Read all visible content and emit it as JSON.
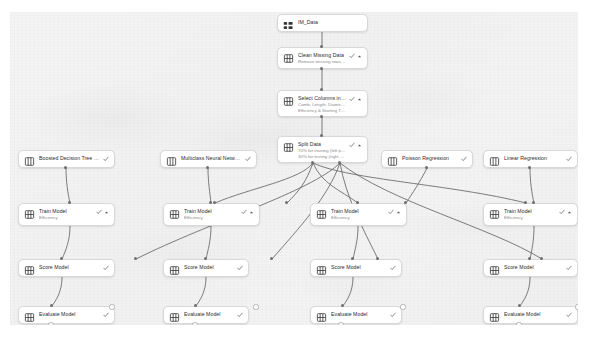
{
  "app": {
    "name": "pipeline-designer-canvas",
    "canvas_background": "#f2f2f2",
    "node_background": "#ffffff",
    "node_border": "#d8d8d8",
    "edge_color": "#4a4a4a",
    "status_icon": "checkmark",
    "status_color": "#5a5a5a"
  },
  "nodes": [
    {
      "id": "dataset",
      "name": "dataset-node",
      "title": "IM_Data",
      "subtitle": "",
      "icon": "dataset-icon",
      "status": "",
      "chevron": false,
      "x": 277,
      "y": 14,
      "w": 91,
      "h": 18
    },
    {
      "id": "clean-missing-data",
      "name": "clean-missing-data-node",
      "title": "Clean Missing Data",
      "subtitle": "Remove missing rows values",
      "icon": "module-icon",
      "status": "check",
      "chevron": true,
      "x": 277,
      "y": 47,
      "w": 91,
      "h": 22
    },
    {
      "id": "select-columns",
      "name": "select-columns-node",
      "title": "Select Columns in Dataset",
      "subtitle": "Comb, Length, Diameter,",
      "subtitle2": "Efficiency & Starting Torque",
      "icon": "module-icon",
      "status": "check",
      "chevron": true,
      "x": 277,
      "y": 90,
      "w": 91,
      "h": 27
    },
    {
      "id": "split-data",
      "name": "split-data-node",
      "title": "Split Data",
      "subtitle": "70% for training (left port)",
      "subtitle2": "30% for testing (right port)",
      "icon": "module-icon",
      "status": "check",
      "chevron": true,
      "x": 277,
      "y": 136,
      "w": 91,
      "h": 27
    },
    {
      "id": "alg-1",
      "name": "boosted-decision-tree-regression-node",
      "title": "Boosted Decision Tree Regre...",
      "subtitle": "",
      "icon": "algorithm-icon",
      "status": "check",
      "chevron": false,
      "x": 18,
      "y": 150,
      "w": 97,
      "h": 18
    },
    {
      "id": "alg-2",
      "name": "multiclass-neural-network-node",
      "title": "Multiclass Neural Network",
      "subtitle": "",
      "icon": "algorithm-icon",
      "status": "check",
      "chevron": false,
      "x": 160,
      "y": 150,
      "w": 97,
      "h": 18
    },
    {
      "id": "alg-3",
      "name": "poisson-regression-node",
      "title": "Poisson Regression",
      "subtitle": "",
      "icon": "algorithm-icon",
      "status": "check",
      "chevron": false,
      "x": 381,
      "y": 150,
      "w": 92,
      "h": 18
    },
    {
      "id": "alg-4",
      "name": "linear-regression-node",
      "title": "Linear Regression",
      "subtitle": "",
      "icon": "algorithm-icon",
      "status": "check",
      "chevron": false,
      "x": 483,
      "y": 150,
      "w": 95,
      "h": 18
    },
    {
      "id": "train-1",
      "name": "train-model-node-1",
      "title": "Train Model",
      "subtitle": "Efficiency",
      "icon": "module-icon",
      "status": "check",
      "chevron": true,
      "x": 18,
      "y": 203,
      "w": 97,
      "h": 23
    },
    {
      "id": "train-2",
      "name": "train-model-node-2",
      "title": "Train Model",
      "subtitle": "Efficiency",
      "icon": "module-icon",
      "status": "check",
      "chevron": true,
      "x": 163,
      "y": 203,
      "w": 97,
      "h": 23
    },
    {
      "id": "train-3",
      "name": "train-model-node-3",
      "title": "Train Model",
      "subtitle": "Efficiency",
      "icon": "module-icon",
      "status": "check",
      "chevron": true,
      "x": 310,
      "y": 203,
      "w": 97,
      "h": 23
    },
    {
      "id": "train-4",
      "name": "train-model-node-4",
      "title": "Train Model",
      "subtitle": "Efficiency",
      "icon": "module-icon",
      "status": "check",
      "chevron": true,
      "x": 483,
      "y": 203,
      "w": 95,
      "h": 23
    },
    {
      "id": "score-1",
      "name": "score-model-node-1",
      "title": "Score Model",
      "subtitle": "",
      "icon": "module-icon",
      "status": "check",
      "chevron": false,
      "x": 18,
      "y": 259,
      "w": 97,
      "h": 18
    },
    {
      "id": "score-2",
      "name": "score-model-node-2",
      "title": "Score Model",
      "subtitle": "",
      "icon": "module-icon",
      "status": "check",
      "chevron": false,
      "x": 163,
      "y": 259,
      "w": 86,
      "h": 18
    },
    {
      "id": "score-3",
      "name": "score-model-node-3",
      "title": "Score Model",
      "subtitle": "",
      "icon": "module-icon",
      "status": "check",
      "chevron": false,
      "x": 310,
      "y": 259,
      "w": 92,
      "h": 18
    },
    {
      "id": "score-4",
      "name": "score-model-node-4",
      "title": "Score Model",
      "subtitle": "",
      "icon": "module-icon",
      "status": "check",
      "chevron": false,
      "x": 483,
      "y": 259,
      "w": 95,
      "h": 18
    },
    {
      "id": "eval-1",
      "name": "evaluate-model-node-1",
      "title": "Evaluate Model",
      "subtitle": "",
      "icon": "module-icon",
      "status": "check",
      "chevron": false,
      "x": 18,
      "y": 306,
      "w": 97,
      "h": 18
    },
    {
      "id": "eval-2",
      "name": "evaluate-model-node-2",
      "title": "Evaluate Model",
      "subtitle": "",
      "icon": "module-icon",
      "status": "check",
      "chevron": false,
      "x": 163,
      "y": 306,
      "w": 86,
      "h": 18
    },
    {
      "id": "eval-3",
      "name": "evaluate-model-node-3",
      "title": "Evaluate Model",
      "subtitle": "",
      "icon": "module-icon",
      "status": "check",
      "chevron": false,
      "x": 310,
      "y": 306,
      "w": 92,
      "h": 18
    },
    {
      "id": "eval-4",
      "name": "evaluate-model-node-4",
      "title": "Evaluate Model",
      "subtitle": "",
      "icon": "module-icon",
      "status": "check",
      "chevron": false,
      "x": 483,
      "y": 306,
      "w": 95,
      "h": 18
    }
  ]
}
